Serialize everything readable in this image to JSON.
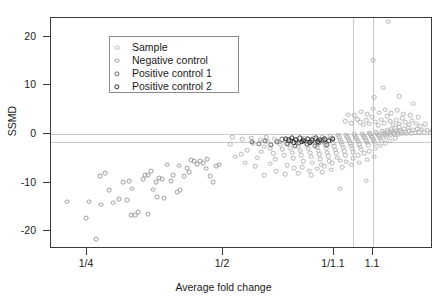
{
  "chart_data": {
    "type": "scatter",
    "title": "",
    "xlabel": "Average fold change",
    "ylabel": "SSMD",
    "grid": false,
    "legend_position": "top-left",
    "x_scale": "log",
    "xticks": [
      {
        "label": "1/4",
        "px": 86
      },
      {
        "label": "1/2",
        "px": 222
      },
      {
        "label": "1/1.1",
        "px": 333
      },
      {
        "label": "1.1",
        "px": 372
      }
    ],
    "yticks": [
      {
        "label": "20",
        "value": 20
      },
      {
        "label": "10",
        "value": 10
      },
      {
        "label": "0",
        "value": 0
      },
      {
        "label": "-10",
        "value": -10
      },
      {
        "label": "-20",
        "value": -20
      }
    ],
    "ylim": [
      -23.5,
      24.5
    ],
    "xlim_px": [
      50,
      432
    ],
    "reference_lines": {
      "horizontal": [
        0,
        -1.6
      ],
      "vertical_px": [
        352,
        372
      ]
    },
    "legend": [
      {
        "label": "Sample",
        "marker": "open-circle",
        "color": "#b4b4b4",
        "class": "s-sample"
      },
      {
        "label": "Negative control",
        "marker": "open-circle",
        "color": "#9a9a9a",
        "class": "s-neg"
      },
      {
        "label": "Positive control 1",
        "marker": "open-circle",
        "color": "#6a6a6a",
        "class": "s-pos1"
      },
      {
        "label": "Positive control 2",
        "marker": "open-circle",
        "color": "#2b2b2b",
        "class": "s-pos2"
      }
    ],
    "series": [
      {
        "name": "Negative control",
        "class": "s-neg",
        "points": [
          [
            66,
            -13.9
          ],
          [
            88,
            -13.9
          ],
          [
            95,
            -21.5
          ],
          [
            85,
            -17.3
          ],
          [
            99,
            -8.6
          ],
          [
            104,
            -8.0
          ],
          [
            122,
            -9.9
          ],
          [
            126,
            -13.6
          ],
          [
            130,
            -16.6
          ],
          [
            134,
            -16.6
          ],
          [
            142,
            -9.3
          ],
          [
            144,
            -8.4
          ],
          [
            147,
            -8.5
          ],
          [
            150,
            -7.7
          ],
          [
            152,
            -11.4
          ],
          [
            155,
            -9.9
          ],
          [
            158,
            -9.1
          ],
          [
            161,
            -9.2
          ],
          [
            166,
            -6.3
          ],
          [
            170,
            -9.6
          ],
          [
            172,
            -8.4
          ],
          [
            176,
            -12.0
          ],
          [
            179,
            -11.6
          ],
          [
            183,
            -8.6
          ],
          [
            186,
            -7.0
          ],
          [
            188,
            -7.8
          ],
          [
            190,
            -5.3
          ],
          [
            193,
            -5.6
          ],
          [
            196,
            -6.2
          ],
          [
            199,
            -5.5
          ],
          [
            202,
            -6.0
          ],
          [
            205,
            -7.1
          ],
          [
            112,
            -14.1
          ],
          [
            118,
            -13.3
          ],
          [
            137,
            -16.0
          ],
          [
            163,
            -13.2
          ],
          [
            206,
            -5.2
          ],
          [
            209,
            -8.7
          ],
          [
            212,
            -9.9
          ],
          [
            215,
            -6.6
          ],
          [
            218,
            -6.3
          ],
          [
            147,
            -16.5
          ],
          [
            108,
            -11.5
          ],
          [
            128,
            -9.6
          ],
          [
            156,
            -12.9
          ],
          [
            178,
            -6.5
          ],
          [
            100,
            -14.5
          ],
          [
            131,
            -11.2
          ]
        ]
      },
      {
        "name": "Sample",
        "class": "s-sample",
        "points": [
          [
            229,
            -2.1
          ],
          [
            240,
            -4.2
          ],
          [
            246,
            -3.3
          ],
          [
            252,
            -1.9
          ],
          [
            256,
            -4.9
          ],
          [
            260,
            -3.6
          ],
          [
            263,
            -2.6
          ],
          [
            266,
            -1.5
          ],
          [
            269,
            -2.9
          ],
          [
            272,
            -3.9
          ],
          [
            274,
            -5.2
          ],
          [
            276,
            -1.4
          ],
          [
            279,
            -2.2
          ],
          [
            281,
            -3.1
          ],
          [
            283,
            -4.3
          ],
          [
            285,
            -1.2
          ],
          [
            287,
            -2.0
          ],
          [
            289,
            -2.9
          ],
          [
            291,
            -3.8
          ],
          [
            292,
            -5.0
          ],
          [
            294,
            -1.1
          ],
          [
            296,
            -1.8
          ],
          [
            297,
            -2.6
          ],
          [
            299,
            -3.4
          ],
          [
            300,
            -4.4
          ],
          [
            302,
            -5.6
          ],
          [
            303,
            -0.9
          ],
          [
            305,
            -1.6
          ],
          [
            306,
            -2.3
          ],
          [
            307,
            -3.0
          ],
          [
            309,
            -3.8
          ],
          [
            310,
            -4.7
          ],
          [
            311,
            -5.9
          ],
          [
            312,
            -0.8
          ],
          [
            314,
            -1.3
          ],
          [
            315,
            -2.0
          ],
          [
            316,
            -2.7
          ],
          [
            317,
            -3.4
          ],
          [
            318,
            -4.2
          ],
          [
            319,
            -5.2
          ],
          [
            320,
            -6.3
          ],
          [
            321,
            -0.6
          ],
          [
            322,
            -1.1
          ],
          [
            323,
            -1.7
          ],
          [
            324,
            -2.3
          ],
          [
            325,
            -3.0
          ],
          [
            326,
            -3.8
          ],
          [
            327,
            -4.6
          ],
          [
            328,
            -5.6
          ],
          [
            329,
            -0.5
          ],
          [
            330,
            -0.9
          ],
          [
            331,
            -1.4
          ],
          [
            332,
            -1.9
          ],
          [
            333,
            -2.5
          ],
          [
            334,
            -3.2
          ],
          [
            335,
            -4.0
          ],
          [
            336,
            -4.9
          ],
          [
            337,
            -0.3
          ],
          [
            338,
            -0.7
          ],
          [
            339,
            -1.2
          ],
          [
            340,
            -1.7
          ],
          [
            341,
            -2.2
          ],
          [
            342,
            -2.8
          ],
          [
            343,
            -3.5
          ],
          [
            344,
            -4.3
          ],
          [
            345,
            -0.2
          ],
          [
            346,
            -0.6
          ],
          [
            347,
            -1.0
          ],
          [
            348,
            -1.4
          ],
          [
            349,
            -1.9
          ],
          [
            350,
            -2.4
          ],
          [
            351,
            -3.0
          ],
          [
            352,
            -3.7
          ],
          [
            353,
            -0.1
          ],
          [
            354,
            -0.4
          ],
          [
            355,
            -0.8
          ],
          [
            356,
            -1.2
          ],
          [
            357,
            -1.6
          ],
          [
            358,
            -2.1
          ],
          [
            359,
            -2.6
          ],
          [
            360,
            -3.2
          ],
          [
            361,
            0.1
          ],
          [
            362,
            -0.2
          ],
          [
            363,
            -0.6
          ],
          [
            364,
            -0.9
          ],
          [
            365,
            -1.3
          ],
          [
            366,
            -1.8
          ],
          [
            367,
            -2.3
          ],
          [
            368,
            0.3
          ],
          [
            369,
            0.0
          ],
          [
            370,
            -0.4
          ],
          [
            371,
            -0.7
          ],
          [
            372,
            -1.1
          ],
          [
            373,
            -1.5
          ],
          [
            374,
            -2.0
          ],
          [
            375,
            0.4
          ],
          [
            376,
            0.1
          ],
          [
            377,
            -0.2
          ],
          [
            378,
            -0.5
          ],
          [
            379,
            -0.9
          ],
          [
            380,
            -1.3
          ],
          [
            381,
            0.6
          ],
          [
            382,
            0.3
          ],
          [
            383,
            0.0
          ],
          [
            384,
            -0.3
          ],
          [
            385,
            -0.7
          ],
          [
            386,
            0.8
          ],
          [
            387,
            0.4
          ],
          [
            388,
            0.1
          ],
          [
            389,
            -0.2
          ],
          [
            390,
            1.0
          ],
          [
            391,
            0.6
          ],
          [
            392,
            0.2
          ],
          [
            393,
            -0.1
          ],
          [
            394,
            1.2
          ],
          [
            395,
            0.7
          ],
          [
            396,
            0.3
          ],
          [
            397,
            0.0
          ],
          [
            398,
            1.4
          ],
          [
            399,
            0.8
          ],
          [
            400,
            0.4
          ],
          [
            401,
            0.1
          ],
          [
            403,
            1.1
          ],
          [
            404,
            0.5
          ],
          [
            405,
            0.1
          ],
          [
            407,
            1.3
          ],
          [
            408,
            0.6
          ],
          [
            410,
            0.2
          ],
          [
            412,
            0.9
          ],
          [
            414,
            0.3
          ],
          [
            416,
            1.1
          ],
          [
            418,
            0.4
          ],
          [
            420,
            0.9
          ],
          [
            423,
            0.4
          ],
          [
            426,
            0.8
          ],
          [
            429,
            0.3
          ],
          [
            431,
            0.7
          ],
          [
            286,
            -6.4
          ],
          [
            293,
            -7.0
          ],
          [
            301,
            -6.8
          ],
          [
            308,
            -7.5
          ],
          [
            316,
            -7.1
          ],
          [
            323,
            -6.6
          ],
          [
            331,
            -6.0
          ],
          [
            339,
            -5.5
          ],
          [
            345,
            -5.7
          ],
          [
            352,
            -5.0
          ],
          [
            357,
            -4.4
          ],
          [
            363,
            -4.0
          ],
          [
            368,
            -3.5
          ],
          [
            374,
            -3.0
          ],
          [
            379,
            -2.4
          ],
          [
            384,
            -1.9
          ],
          [
            389,
            -1.4
          ],
          [
            394,
            -0.9
          ],
          [
            263,
            -8.5
          ],
          [
            275,
            -7.7
          ],
          [
            284,
            -8.3
          ],
          [
            297,
            -8.0
          ],
          [
            310,
            -8.4
          ],
          [
            321,
            -7.9
          ],
          [
            330,
            -7.3
          ],
          [
            341,
            -6.8
          ],
          [
            350,
            -6.3
          ],
          [
            358,
            -5.9
          ],
          [
            366,
            -5.3
          ],
          [
            373,
            -4.7
          ],
          [
            344,
            2.6
          ],
          [
            350,
            2.2
          ],
          [
            356,
            3.0
          ],
          [
            359,
            2.4
          ],
          [
            362,
            1.9
          ],
          [
            365,
            2.8
          ],
          [
            368,
            2.1
          ],
          [
            371,
            3.4
          ],
          [
            374,
            2.5
          ],
          [
            377,
            1.8
          ],
          [
            380,
            2.9
          ],
          [
            383,
            2.2
          ],
          [
            386,
            3.6
          ],
          [
            389,
            2.6
          ],
          [
            392,
            1.9
          ],
          [
            395,
            2.8
          ],
          [
            398,
            2.1
          ],
          [
            401,
            3.2
          ],
          [
            404,
            2.4
          ],
          [
            408,
            1.9
          ],
          [
            411,
            2.7
          ],
          [
            415,
            2.1
          ],
          [
            419,
            1.6
          ],
          [
            424,
            2.0
          ],
          [
            347,
            4.0
          ],
          [
            353,
            3.8
          ],
          [
            360,
            4.6
          ],
          [
            366,
            4.1
          ],
          [
            372,
            5.2
          ],
          [
            378,
            4.4
          ],
          [
            384,
            5.0
          ],
          [
            390,
            4.3
          ],
          [
            396,
            4.9
          ],
          [
            402,
            4.2
          ],
          [
            409,
            3.8
          ],
          [
            417,
            3.5
          ],
          [
            373,
            7.5
          ],
          [
            372,
            15.2
          ],
          [
            387,
            23.1
          ],
          [
            382,
            9.5
          ],
          [
            398,
            7.8
          ],
          [
            412,
            6.2
          ],
          [
            339,
            -11.2
          ],
          [
            365,
            -9.6
          ],
          [
            244,
            -5.9
          ],
          [
            234,
            -4.7
          ],
          [
            254,
            -6.6
          ],
          [
            269,
            -6.1
          ],
          [
            231,
            -0.6
          ],
          [
            241,
            -1.1
          ],
          [
            250,
            -0.8
          ],
          [
            259,
            -1.2
          ],
          [
            265,
            -0.7
          ],
          [
            273,
            -1.0
          ]
        ]
      },
      {
        "name": "Positive control 1",
        "class": "s-pos1",
        "points": [
          [
            251,
            -1.6
          ],
          [
            258,
            -2.0
          ],
          [
            264,
            -1.4
          ],
          [
            270,
            -2.3
          ],
          [
            276,
            -1.7
          ],
          [
            281,
            -1.1
          ],
          [
            286,
            -2.0
          ],
          [
            290,
            -1.5
          ],
          [
            294,
            -2.4
          ],
          [
            298,
            -1.8
          ],
          [
            302,
            -1.2
          ],
          [
            306,
            -2.1
          ],
          [
            310,
            -1.6
          ],
          [
            314,
            -2.5
          ],
          [
            318,
            -1.9
          ],
          [
            322,
            -1.3
          ],
          [
            326,
            -2.2
          ]
        ]
      },
      {
        "name": "Positive control 2",
        "class": "s-pos2",
        "points": [
          [
            285,
            -1.0
          ],
          [
            288,
            -1.3
          ],
          [
            291,
            -0.8
          ],
          [
            295,
            -1.2
          ],
          [
            299,
            -0.9
          ],
          [
            303,
            -1.4
          ],
          [
            307,
            -1.0
          ],
          [
            311,
            -1.3
          ],
          [
            315,
            -0.9
          ],
          [
            319,
            -1.2
          ],
          [
            293,
            -1.7
          ],
          [
            301,
            -1.6
          ],
          [
            309,
            -1.7
          ],
          [
            317,
            -1.5
          ],
          [
            324,
            -1.1
          ],
          [
            328,
            -1.4
          ],
          [
            332,
            -1.0
          ]
        ]
      }
    ]
  }
}
